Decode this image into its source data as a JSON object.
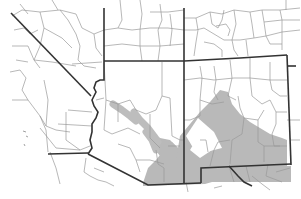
{
  "map": {
    "title": "",
    "region": "Southwestern United States (California, Nevada, Utah, Colorado, Arizona, New Mexico) and northern Mexico",
    "features": {
      "state_borders": [
        "California",
        "Nevada",
        "Utah",
        "Colorado",
        "Arizona",
        "New Mexico",
        "Mexico"
      ],
      "county_borders": true,
      "shaded_range": "southern Arizona and southwestern New Mexico into northern Mexico, with a narrow band along the Colorado/Gila river corridor"
    },
    "colors": {
      "background": "#ffffff",
      "state_border": "#333333",
      "county_border": "#9a9a9a",
      "range_fill": "#b9b9b9"
    }
  }
}
